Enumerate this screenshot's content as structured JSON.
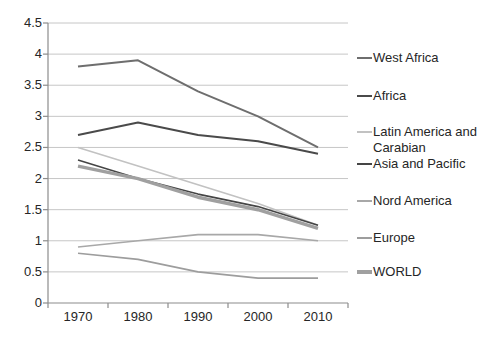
{
  "chart_data": {
    "type": "line",
    "title": "",
    "xlabel": "",
    "ylabel": "",
    "categories": [
      "1970",
      "1980",
      "1990",
      "2000",
      "2010"
    ],
    "series": [
      {
        "name": "West Africa",
        "values": [
          3.8,
          3.9,
          3.4,
          3.0,
          2.5
        ],
        "color": "#6e6e6e",
        "width": 2
      },
      {
        "name": "Africa",
        "values": [
          2.7,
          2.9,
          2.7,
          2.6,
          2.4
        ],
        "color": "#4a4a4a",
        "width": 2
      },
      {
        "name": "Latin America and Carabian",
        "values": [
          2.5,
          2.2,
          1.9,
          1.6,
          1.25
        ],
        "color": "#c2c2c2",
        "width": 1.6
      },
      {
        "name": "Asia and Pacific",
        "values": [
          2.3,
          2.0,
          1.75,
          1.55,
          1.25
        ],
        "color": "#454545",
        "width": 1.6
      },
      {
        "name": "Nord America",
        "values": [
          0.9,
          1.0,
          1.1,
          1.1,
          1.0
        ],
        "color": "#a8a8a8",
        "width": 1.6
      },
      {
        "name": "Europe",
        "values": [
          0.8,
          0.7,
          0.5,
          0.4,
          0.4
        ],
        "color": "#9d9d9d",
        "width": 1.6
      },
      {
        "name": "WORLD",
        "values": [
          2.2,
          2.0,
          1.7,
          1.5,
          1.2
        ],
        "color": "#a0a0a0",
        "width": 3.5
      }
    ],
    "ylim": [
      0,
      4.5
    ],
    "yticks": [
      "4.5",
      "4",
      "3.5",
      "3",
      "2.5",
      "2",
      "1.5",
      "1",
      "0.5",
      "0"
    ],
    "grid": true,
    "legend_position": "right",
    "colors": {
      "gridline": "#c6c6c6",
      "axis": "#8c8c8c",
      "text": "#262626",
      "background": "#ffffff"
    }
  }
}
